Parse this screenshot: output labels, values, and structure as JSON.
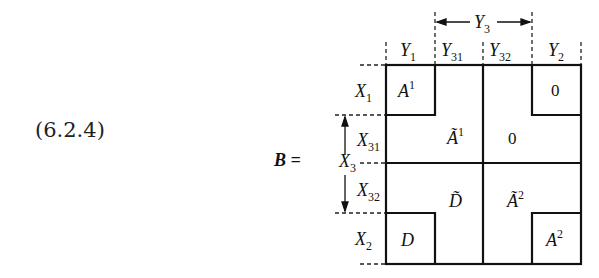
{
  "equation_number": "(6.2.4)",
  "matrix_name": "B =",
  "column_labels": {
    "y1": {
      "base": "Y",
      "sub": "1"
    },
    "y31": {
      "base": "Y",
      "sub": "31"
    },
    "y32": {
      "base": "Y",
      "sub": "32"
    },
    "y2": {
      "base": "Y",
      "sub": "2"
    },
    "y3": {
      "base": "Y",
      "sub": "3"
    }
  },
  "row_labels": {
    "x1": {
      "base": "X",
      "sub": "1"
    },
    "x31": {
      "base": "X",
      "sub": "31"
    },
    "x3": {
      "base": "X",
      "sub": "3"
    },
    "x32": {
      "base": "X",
      "sub": "32"
    },
    "x2": {
      "base": "X",
      "sub": "2"
    }
  },
  "blocks": {
    "a1": {
      "base": "A",
      "sup": "1"
    },
    "zero_top_right": "0",
    "a1_tilde": {
      "base": "Ã",
      "sup": "1"
    },
    "zero_middle": "0",
    "d_tilde": {
      "base": "D̃"
    },
    "a2_tilde": {
      "base": "Ã",
      "sup": "2"
    },
    "d": {
      "base": "D"
    },
    "a2": {
      "base": "A",
      "sup": "2"
    }
  }
}
